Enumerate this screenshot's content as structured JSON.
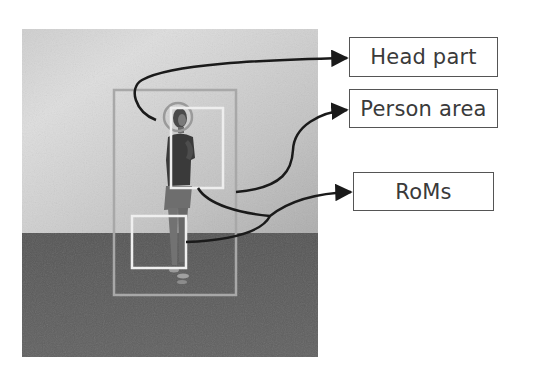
{
  "figure": {
    "photo": {
      "description": "grayscale photo of a standing person, light wall above, dark floor below",
      "x": 22,
      "y": 29,
      "width": 296,
      "height": 328,
      "wall_color_light": "#d6d6d6",
      "wall_color_dark": "#b4b4b4",
      "floor_color": "#5e5e5e",
      "horizon_y": 233
    },
    "overlays": {
      "person_area_box": {
        "x": 114,
        "y": 90,
        "width": 122,
        "height": 205,
        "color": "#a8a8a8"
      },
      "head_circle": {
        "cx": 178,
        "cy": 117,
        "r": 14,
        "color": "#9a9a9a"
      },
      "rom_upper": {
        "x": 171,
        "y": 108,
        "width": 52,
        "height": 80,
        "color": "#eeeeee"
      },
      "rom_lower": {
        "x": 132,
        "y": 216,
        "width": 54,
        "height": 52,
        "color": "#efefef"
      }
    },
    "labels": [
      {
        "id": "head",
        "text": "Head part",
        "x": 349,
        "y": 37,
        "width": 149,
        "height": 40
      },
      {
        "id": "person",
        "text": "Person area",
        "x": 349,
        "y": 89,
        "width": 149,
        "height": 39
      },
      {
        "id": "roms",
        "text": "RoMs",
        "x": 353,
        "y": 172,
        "width": 141,
        "height": 39
      }
    ],
    "arrow_color": "#1a1a1a"
  }
}
